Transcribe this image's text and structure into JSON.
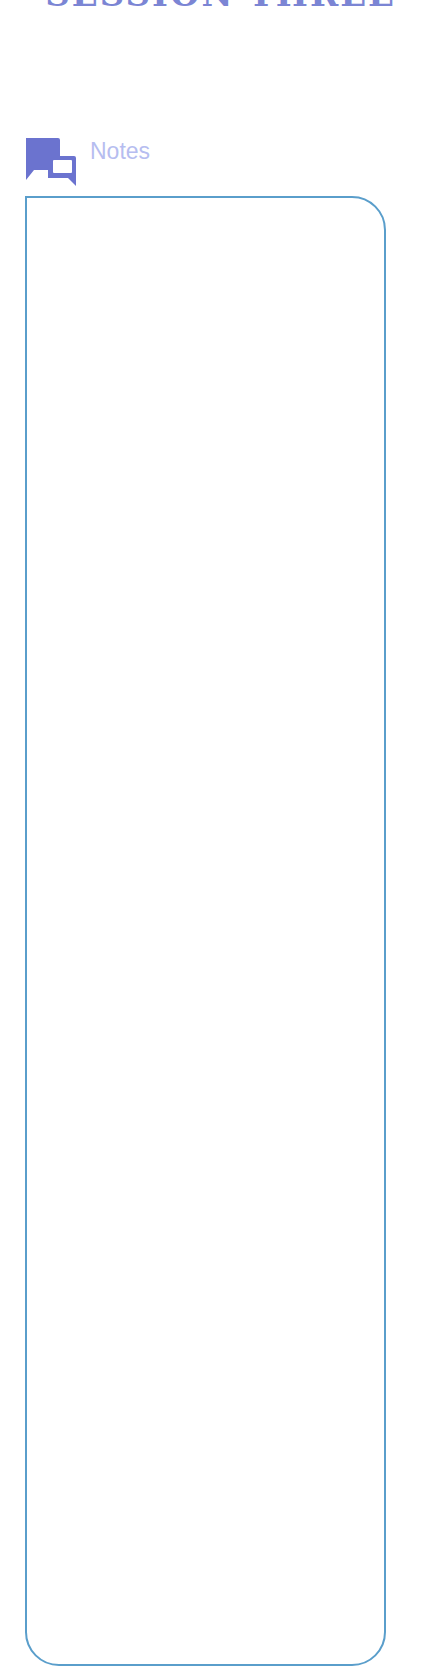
{
  "page": {
    "title": "SESSION THREE"
  },
  "notes": {
    "label": "Notes",
    "icon": "chat-bubbles-icon",
    "content": ""
  },
  "colors": {
    "title": "#7b85d4",
    "icon": "#6b73cf",
    "label": "#b6bdf0",
    "box_border": "#5a9ecb"
  }
}
